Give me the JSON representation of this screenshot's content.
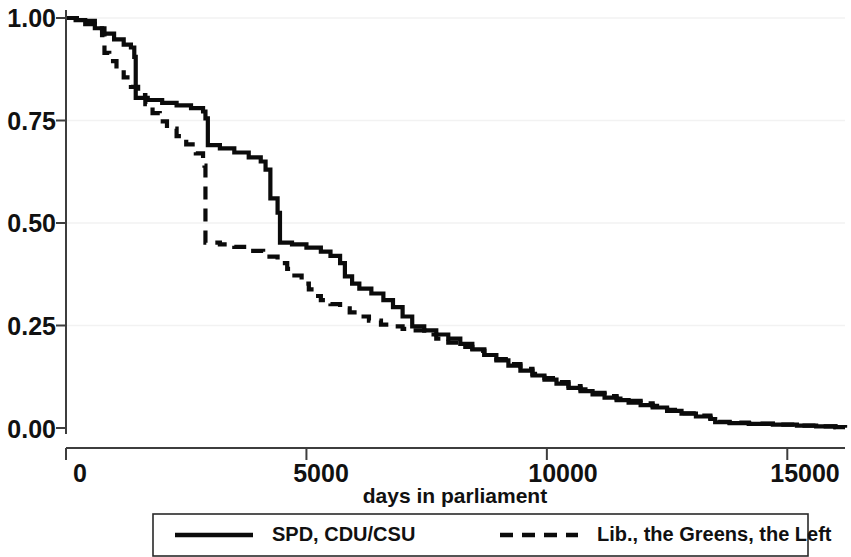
{
  "chart_data": {
    "type": "line",
    "title": "",
    "subtitle": "",
    "xlabel": "days in parliament",
    "ylabel": "",
    "xlim": [
      0,
      16200
    ],
    "ylim": [
      0,
      1.0
    ],
    "grid": true,
    "grid_axis": "y",
    "legend_position": "bottom",
    "x_ticks": [
      0,
      5000,
      10000,
      15000
    ],
    "x_tick_labels": [
      "0",
      "5000",
      "10000",
      "15000"
    ],
    "y_ticks": [
      0.0,
      0.25,
      0.5,
      0.75,
      1.0
    ],
    "y_tick_labels": [
      "0.00",
      "0.25",
      "0.50",
      "0.75",
      "1.00"
    ],
    "annotations": [],
    "series": [
      {
        "name": "SPD, CDU/CSU",
        "style": "solid",
        "color": "#0b0b0b",
        "points": [
          [
            0,
            1.0
          ],
          [
            200,
            0.995
          ],
          [
            400,
            0.985
          ],
          [
            600,
            0.975
          ],
          [
            800,
            0.962
          ],
          [
            1000,
            0.948
          ],
          [
            1200,
            0.935
          ],
          [
            1350,
            0.928
          ],
          [
            1420,
            0.905
          ],
          [
            1450,
            0.805
          ],
          [
            1700,
            0.8
          ],
          [
            2000,
            0.793
          ],
          [
            2300,
            0.787
          ],
          [
            2600,
            0.78
          ],
          [
            2850,
            0.772
          ],
          [
            2900,
            0.755
          ],
          [
            2950,
            0.69
          ],
          [
            3200,
            0.682
          ],
          [
            3500,
            0.672
          ],
          [
            3800,
            0.66
          ],
          [
            4050,
            0.65
          ],
          [
            4150,
            0.63
          ],
          [
            4250,
            0.56
          ],
          [
            4400,
            0.525
          ],
          [
            4450,
            0.452
          ],
          [
            4700,
            0.448
          ],
          [
            5000,
            0.44
          ],
          [
            5300,
            0.43
          ],
          [
            5500,
            0.42
          ],
          [
            5700,
            0.402
          ],
          [
            5800,
            0.37
          ],
          [
            5950,
            0.352
          ],
          [
            6100,
            0.34
          ],
          [
            6350,
            0.328
          ],
          [
            6600,
            0.312
          ],
          [
            6800,
            0.295
          ],
          [
            7000,
            0.272
          ],
          [
            7200,
            0.248
          ],
          [
            7450,
            0.238
          ],
          [
            7700,
            0.228
          ],
          [
            7950,
            0.218
          ],
          [
            8200,
            0.205
          ],
          [
            8450,
            0.192
          ],
          [
            8700,
            0.178
          ],
          [
            8950,
            0.165
          ],
          [
            9200,
            0.152
          ],
          [
            9450,
            0.14
          ],
          [
            9700,
            0.128
          ],
          [
            9950,
            0.118
          ],
          [
            10200,
            0.108
          ],
          [
            10450,
            0.098
          ],
          [
            10700,
            0.09
          ],
          [
            10950,
            0.082
          ],
          [
            11200,
            0.074
          ],
          [
            11450,
            0.068
          ],
          [
            11700,
            0.062
          ],
          [
            11950,
            0.056
          ],
          [
            12200,
            0.05
          ],
          [
            12500,
            0.042
          ],
          [
            12800,
            0.035
          ],
          [
            13100,
            0.028
          ],
          [
            13400,
            0.022
          ],
          [
            13500,
            0.014
          ],
          [
            13800,
            0.012
          ],
          [
            14200,
            0.01
          ],
          [
            14700,
            0.008
          ],
          [
            15200,
            0.006
          ],
          [
            15600,
            0.004
          ],
          [
            16000,
            0.002
          ],
          [
            16200,
            0.001
          ]
        ]
      },
      {
        "name": "Lib., the Greens, the Left",
        "style": "dashed",
        "color": "#0b0b0b",
        "points": [
          [
            0,
            1.0
          ],
          [
            300,
            0.993
          ],
          [
            600,
            0.975
          ],
          [
            750,
            0.958
          ],
          [
            800,
            0.915
          ],
          [
            900,
            0.895
          ],
          [
            1050,
            0.875
          ],
          [
            1200,
            0.855
          ],
          [
            1350,
            0.832
          ],
          [
            1500,
            0.812
          ],
          [
            1650,
            0.79
          ],
          [
            1800,
            0.768
          ],
          [
            1950,
            0.748
          ],
          [
            2100,
            0.73
          ],
          [
            2300,
            0.712
          ],
          [
            2500,
            0.692
          ],
          [
            2700,
            0.67
          ],
          [
            2850,
            0.65
          ],
          [
            2880,
            0.64
          ],
          [
            2900,
            0.452
          ],
          [
            3200,
            0.448
          ],
          [
            3500,
            0.442
          ],
          [
            3800,
            0.432
          ],
          [
            4100,
            0.418
          ],
          [
            4400,
            0.402
          ],
          [
            4600,
            0.388
          ],
          [
            4750,
            0.372
          ],
          [
            4900,
            0.352
          ],
          [
            5050,
            0.338
          ],
          [
            5150,
            0.322
          ],
          [
            5300,
            0.312
          ],
          [
            5500,
            0.302
          ],
          [
            5700,
            0.292
          ],
          [
            5900,
            0.282
          ],
          [
            6100,
            0.272
          ],
          [
            6300,
            0.262
          ],
          [
            6550,
            0.252
          ],
          [
            6800,
            0.248
          ],
          [
            7000,
            0.242
          ],
          [
            7200,
            0.238
          ],
          [
            7450,
            0.228
          ],
          [
            7700,
            0.218
          ],
          [
            7950,
            0.208
          ],
          [
            8200,
            0.198
          ],
          [
            8450,
            0.188
          ],
          [
            8700,
            0.178
          ],
          [
            8950,
            0.168
          ],
          [
            9200,
            0.156
          ],
          [
            9450,
            0.144
          ],
          [
            9700,
            0.132
          ],
          [
            9950,
            0.122
          ],
          [
            10200,
            0.112
          ],
          [
            10450,
            0.102
          ],
          [
            10700,
            0.094
          ],
          [
            10950,
            0.086
          ],
          [
            11200,
            0.078
          ],
          [
            11450,
            0.072
          ],
          [
            11700,
            0.066
          ],
          [
            11950,
            0.06
          ],
          [
            12200,
            0.054
          ],
          [
            12500,
            0.044
          ],
          [
            12800,
            0.036
          ],
          [
            13100,
            0.03
          ],
          [
            13400,
            0.024
          ],
          [
            13500,
            0.015
          ],
          [
            13800,
            0.013
          ],
          [
            14200,
            0.011
          ],
          [
            14700,
            0.008
          ],
          [
            15200,
            0.006
          ],
          [
            15600,
            0.004
          ],
          [
            16000,
            0.002
          ],
          [
            16200,
            0.001
          ]
        ]
      }
    ]
  },
  "legend": {
    "entries": [
      {
        "label": "SPD, CDU/CSU"
      },
      {
        "label": "Lib., the Greens, the Left"
      }
    ]
  },
  "axes": {
    "x_title": "days in parliament",
    "x_labels": [
      "0",
      "5000",
      "10000",
      "15000"
    ],
    "y_labels": [
      "1.00",
      "0.75",
      "0.50",
      "0.25",
      "0.00"
    ]
  }
}
